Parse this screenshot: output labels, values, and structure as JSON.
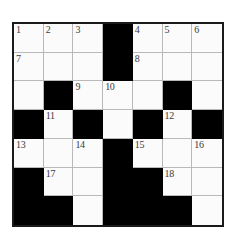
{
  "puzzle": {
    "title": "Crossword Grid",
    "rows": 7,
    "cols": 7,
    "colors": {
      "block": "#000000",
      "cell": "#fbfbfb",
      "grid_line": "#b9b9b9",
      "border": "#1a1a1a",
      "number_text": "#3a3a3a",
      "page_background": "#ffffff"
    },
    "grid": [
      [
        {
          "type": "white",
          "number": "1"
        },
        {
          "type": "white",
          "number": "2"
        },
        {
          "type": "white",
          "number": "3"
        },
        {
          "type": "black",
          "number": ""
        },
        {
          "type": "white",
          "number": "4"
        },
        {
          "type": "white",
          "number": "5"
        },
        {
          "type": "white",
          "number": "6"
        }
      ],
      [
        {
          "type": "white",
          "number": "7"
        },
        {
          "type": "white",
          "number": ""
        },
        {
          "type": "white",
          "number": ""
        },
        {
          "type": "black",
          "number": ""
        },
        {
          "type": "white",
          "number": "8"
        },
        {
          "type": "white",
          "number": ""
        },
        {
          "type": "white",
          "number": ""
        }
      ],
      [
        {
          "type": "white",
          "number": ""
        },
        {
          "type": "black",
          "number": ""
        },
        {
          "type": "white",
          "number": "9"
        },
        {
          "type": "white",
          "number": "10"
        },
        {
          "type": "white",
          "number": ""
        },
        {
          "type": "black",
          "number": ""
        },
        {
          "type": "white",
          "number": ""
        }
      ],
      [
        {
          "type": "black",
          "number": ""
        },
        {
          "type": "white",
          "number": "11"
        },
        {
          "type": "black",
          "number": ""
        },
        {
          "type": "white",
          "number": ""
        },
        {
          "type": "black",
          "number": ""
        },
        {
          "type": "white",
          "number": "12"
        },
        {
          "type": "black",
          "number": ""
        }
      ],
      [
        {
          "type": "white",
          "number": "13"
        },
        {
          "type": "white",
          "number": ""
        },
        {
          "type": "white",
          "number": "14"
        },
        {
          "type": "black",
          "number": ""
        },
        {
          "type": "white",
          "number": "15"
        },
        {
          "type": "white",
          "number": ""
        },
        {
          "type": "white",
          "number": "16"
        }
      ],
      [
        {
          "type": "black",
          "number": ""
        },
        {
          "type": "white",
          "number": "17"
        },
        {
          "type": "white",
          "number": ""
        },
        {
          "type": "black",
          "number": ""
        },
        {
          "type": "black",
          "number": ""
        },
        {
          "type": "white",
          "number": "18"
        },
        {
          "type": "white",
          "number": ""
        }
      ],
      [
        {
          "type": "black",
          "number": ""
        },
        {
          "type": "black",
          "number": ""
        },
        {
          "type": "white",
          "number": ""
        },
        {
          "type": "black",
          "number": ""
        },
        {
          "type": "black",
          "number": ""
        },
        {
          "type": "black",
          "number": ""
        },
        {
          "type": "white",
          "number": ""
        }
      ]
    ]
  }
}
